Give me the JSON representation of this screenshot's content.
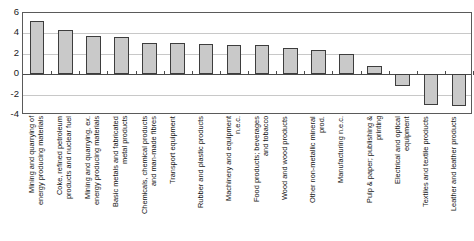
{
  "chart_data": {
    "type": "bar",
    "title": "",
    "subtitle": "",
    "xlabel": "",
    "ylabel": "",
    "ylim": [
      -4,
      6
    ],
    "ytick_values": [
      6,
      4,
      2,
      0,
      -2,
      -4
    ],
    "ytick_labels": [
      "6",
      "4",
      "2",
      "0",
      "-2",
      "-4"
    ],
    "grid": true,
    "legend": "none",
    "categories": [
      "Mining and quarrying of\nenergy producing materials",
      "Coke, refined petroleum\nproducts and nuclear fuel",
      "Mining and quarrying, ex.\nenergy producing materials",
      "Basic metals and fabricated\nmetal products",
      "Chemicals, chemical products\nand man-made fibres",
      "Transport equipment",
      "Rubber and plastic products",
      "Machinery and equipment\nn.e.c.",
      "Food products; beverages\nand tobacco",
      "Wood and wood products",
      "Other non-metallic mineral\nprod.",
      "Manufacturing n.e.c.",
      "Pulp & paper; publishing &\nprinting",
      "Electrical and optical\nequipment",
      "Textiles and textile products",
      "Leather and leather products"
    ],
    "values": [
      5.2,
      4.3,
      3.75,
      3.6,
      3.05,
      3.05,
      2.95,
      2.9,
      2.9,
      2.6,
      2.35,
      2.0,
      0.8,
      -1.2,
      -3.0,
      -3.1
    ]
  },
  "axis": {
    "y_top_label": "6",
    "y_bottom_label": "-4"
  }
}
